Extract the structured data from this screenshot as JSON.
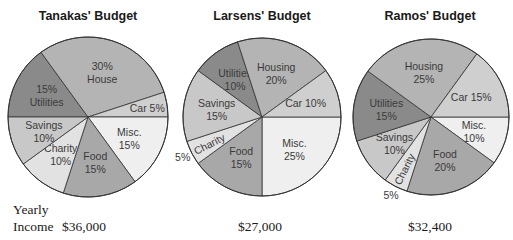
{
  "chart_data": [
    {
      "type": "pie",
      "title": "Tanakas' Budget",
      "yearly_income": "$36,000",
      "slices": [
        {
          "label": "Utilities",
          "value": 15,
          "text": [
            "15%",
            "Utilities"
          ],
          "color": "#8a8a8a"
        },
        {
          "label": "House",
          "value": 30,
          "text": [
            "30%",
            "House"
          ],
          "color": "#b4b4b4"
        },
        {
          "label": "Car",
          "value": 5,
          "text": [
            "Car 5%"
          ],
          "color": "#cfcfcf"
        },
        {
          "label": "Misc.",
          "value": 15,
          "text": [
            "Misc.",
            "15%"
          ],
          "color": "#efefef"
        },
        {
          "label": "Food",
          "value": 15,
          "text": [
            "Food",
            "15%"
          ],
          "color": "#a8a8a8"
        },
        {
          "label": "Charity",
          "value": 10,
          "text": [
            "Charity",
            "10%"
          ],
          "color": "#e2e2e2"
        },
        {
          "label": "Savings",
          "value": 10,
          "text": [
            "Savings",
            "10%"
          ],
          "color": "#c8c8c8"
        }
      ]
    },
    {
      "type": "pie",
      "title": "Larsens' Budget",
      "yearly_income": "$27,000",
      "slices": [
        {
          "label": "Misc.",
          "value": 25,
          "text": [
            "Misc.",
            "25%"
          ],
          "color": "#efefef"
        },
        {
          "label": "Food",
          "value": 15,
          "text": [
            "Food",
            "15%"
          ],
          "color": "#a8a8a8"
        },
        {
          "label": "Charity",
          "value": 5,
          "text": [
            "Charity"
          ],
          "outside_text": "5%",
          "color": "#e2e2e2"
        },
        {
          "label": "Savings",
          "value": 15,
          "text": [
            "Savings",
            "15%"
          ],
          "color": "#c8c8c8"
        },
        {
          "label": "Utilities",
          "value": 10,
          "text": [
            "Utilities",
            "10%"
          ],
          "color": "#8a8a8a"
        },
        {
          "label": "Housing",
          "value": 20,
          "text": [
            "Housing",
            "20%"
          ],
          "color": "#b4b4b4"
        },
        {
          "label": "Car",
          "value": 10,
          "text": [
            "Car 10%"
          ],
          "color": "#cfcfcf"
        }
      ]
    },
    {
      "type": "pie",
      "title": "Ramos' Budget",
      "yearly_income": "$32,400",
      "slices": [
        {
          "label": "Misc.",
          "value": 10,
          "text": [
            "Misc.",
            "10%"
          ],
          "color": "#efefef"
        },
        {
          "label": "Food",
          "value": 20,
          "text": [
            "Food",
            "20%"
          ],
          "color": "#a8a8a8"
        },
        {
          "label": "Charity",
          "value": 5,
          "text": [
            "Charity"
          ],
          "outside_text": "5%",
          "color": "#e2e2e2"
        },
        {
          "label": "Savings",
          "value": 10,
          "text": [
            "Savings",
            "10%"
          ],
          "color": "#c8c8c8"
        },
        {
          "label": "Utilities",
          "value": 15,
          "text": [
            "Utilities",
            "15%"
          ],
          "color": "#8a8a8a"
        },
        {
          "label": "Housing",
          "value": 25,
          "text": [
            "Housing",
            "25%"
          ],
          "color": "#b4b4b4"
        },
        {
          "label": "Car",
          "value": 15,
          "text": [
            "Car 15%"
          ],
          "color": "#cfcfcf"
        }
      ]
    }
  ],
  "row_label": {
    "line1": "Yearly",
    "line2": "Income"
  },
  "titles": [
    "Tanakas' Budget",
    "Larsens' Budget",
    "Ramos' Budget"
  ],
  "incomes": [
    "$36,000",
    "$27,000",
    "$32,400"
  ]
}
